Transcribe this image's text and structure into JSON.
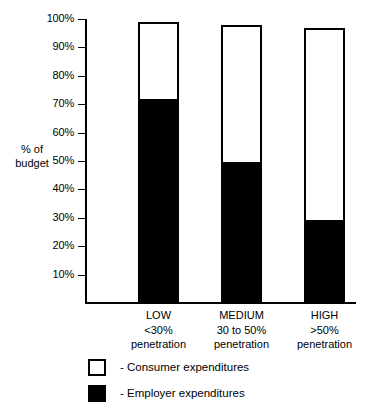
{
  "chart_data": {
    "type": "bar",
    "subtype": "stacked-100",
    "title": "",
    "xlabel": "",
    "ylabel": "% of budget",
    "ylim": [
      0,
      100
    ],
    "grid": false,
    "legend_position": "bottom-left",
    "categories": [
      "LOW",
      "MEDIUM",
      "HIGH"
    ],
    "category_sublabels": [
      {
        "line1": "<30%",
        "line2": "penetration"
      },
      {
        "line1": "30 to 50%",
        "line2": "penetration"
      },
      {
        "line1": ">50%",
        "line2": "penetration"
      }
    ],
    "ytick_labels": [
      "100%",
      "90%",
      "80%",
      "70%",
      "60%",
      "50%",
      "40%",
      "30%",
      "20%",
      "10%"
    ],
    "ytick_values": [
      100,
      90,
      80,
      70,
      60,
      50,
      40,
      30,
      20,
      10
    ],
    "series": [
      {
        "name": "- Employer expenditures",
        "key": "employer",
        "color": "#000000",
        "values": [
          71,
          49,
          28.5
        ]
      },
      {
        "name": "- Consumer expenditures",
        "key": "consumer",
        "color": "#ffffff",
        "values": [
          28,
          49,
          68.5
        ]
      }
    ],
    "bar_totals": [
      99,
      98,
      97
    ]
  },
  "axis": {
    "y_title_line1": "% of",
    "y_title_line2": "budget"
  },
  "legend": {
    "items": [
      {
        "label": "- Consumer expenditures",
        "swatch": "hollow"
      },
      {
        "label": "- Employer expenditures",
        "swatch": "filled"
      }
    ]
  },
  "colors": {
    "ink": "#000000",
    "paper": "#ffffff"
  }
}
